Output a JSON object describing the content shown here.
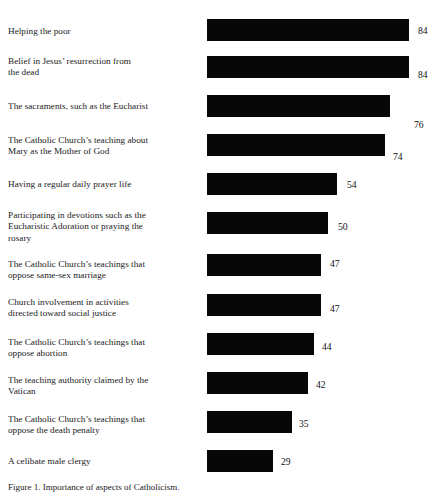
{
  "chart_data": {
    "type": "bar",
    "orientation": "horizontal",
    "title": "",
    "subtitle": "",
    "xlabel": "",
    "ylabel": "",
    "xlim": [
      0,
      100
    ],
    "grid": false,
    "legend": null,
    "value_suffix": "",
    "bar_color": "#070707",
    "categories": [
      "Helping the poor",
      "Belief in Jesus’ resurrection from the dead",
      "The sacraments, such as the Eucharist",
      "The Catholic Church’s teaching about Mary as the Mother of God",
      "Having a regular daily prayer life",
      "Participating in devotions such as the Eucharistic Adoration or praying the rosary",
      "The Catholic Church’s teachings that oppose same-sex marriage",
      "Church involvement in activities directed toward social justice",
      "The Catholic Church’s teachings that oppose abortion",
      "The teaching authority claimed by the Vatican",
      "The Catholic Church’s teachings that oppose the death penalty",
      "A celibate male clergy"
    ],
    "values": [
      84,
      84,
      76,
      74,
      54,
      50,
      47,
      47,
      44,
      42,
      35,
      29
    ]
  },
  "rows": [
    {
      "label": "Helping the poor",
      "value": "84",
      "label_lines": [
        "Helping the poor"
      ],
      "bar_top": 19,
      "label_top": 26,
      "value_top": 26,
      "bar_width": 202,
      "value_left": 418
    },
    {
      "label": "Belief in Jesus’ resurrection from the dead",
      "value": "84",
      "label_lines": [
        "Belief in Jesus’ resurrection from",
        "the dead"
      ],
      "bar_top": 56,
      "label_top": 56,
      "value_top": 70,
      "bar_width": 202,
      "value_left": 418
    },
    {
      "label": "The sacraments, such as the Eucharist",
      "value": "76",
      "label_lines": [
        "The sacraments, such as the Eucharist"
      ],
      "bar_top": 95,
      "label_top": 101,
      "value_top": 120,
      "bar_width": 183,
      "value_left": 414
    },
    {
      "label": "The Catholic Church’s teaching about Mary as the Mother of God",
      "value": "74",
      "label_lines": [
        "The Catholic Church’s teaching about",
        "Mary as the Mother of God"
      ],
      "bar_top": 134,
      "label_top": 135,
      "value_top": 152,
      "bar_width": 178,
      "value_left": 393
    },
    {
      "label": "Having a regular daily prayer life",
      "value": "54",
      "label_lines": [
        "Having a regular daily prayer life"
      ],
      "bar_top": 173,
      "label_top": 179,
      "value_top": 180,
      "bar_width": 130,
      "value_left": 347
    },
    {
      "label": "Participating in devotions such as the Eucharistic Adoration or praying the rosary",
      "value": "50",
      "label_lines": [
        "Participating in devotions such as the",
        "Eucharistic Adoration or praying the",
        "rosary"
      ],
      "bar_top": 212,
      "label_top": 210,
      "value_top": 222,
      "bar_width": 121,
      "value_left": 338
    },
    {
      "label": "The Catholic Church’s teachings that oppose same-sex marriage",
      "value": "47",
      "label_lines": [
        "The Catholic Church’s teachings that",
        "oppose same-sex marriage"
      ],
      "bar_top": 254,
      "label_top": 259,
      "value_top": 259,
      "bar_width": 114,
      "value_left": 330
    },
    {
      "label": "Church involvement in activities directed toward social justice",
      "value": "47",
      "label_lines": [
        "Church involvement in activities",
        "directed toward social justice"
      ],
      "bar_top": 294,
      "label_top": 297,
      "value_top": 304,
      "bar_width": 114,
      "value_left": 330
    },
    {
      "label": "The Catholic Church’s teachings that oppose abortion",
      "value": "44",
      "label_lines": [
        "The Catholic Church’s teachings that",
        "oppose abortion"
      ],
      "bar_top": 333,
      "label_top": 337,
      "value_top": 342,
      "bar_width": 107,
      "value_left": 322
    },
    {
      "label": "The teaching authority claimed by the Vatican",
      "value": "42",
      "label_lines": [
        "The teaching authority claimed by the",
        "Vatican"
      ],
      "bar_top": 372,
      "label_top": 375,
      "value_top": 380,
      "bar_width": 101,
      "value_left": 316
    },
    {
      "label": "The Catholic Church’s teachings that oppose the death penalty",
      "value": "35",
      "label_lines": [
        "The Catholic Church’s teachings that",
        "oppose the death penalty"
      ],
      "bar_top": 411,
      "label_top": 414,
      "value_top": 419,
      "bar_width": 85,
      "value_left": 299
    },
    {
      "label": "A celibate male clergy",
      "value": "29",
      "label_lines": [
        "A celibate male clergy"
      ],
      "bar_top": 450,
      "label_top": 456,
      "value_top": 457,
      "bar_width": 66,
      "value_left": 281
    }
  ],
  "caption": {
    "text": "Figure 1. Importance of aspects of Catholicism."
  }
}
